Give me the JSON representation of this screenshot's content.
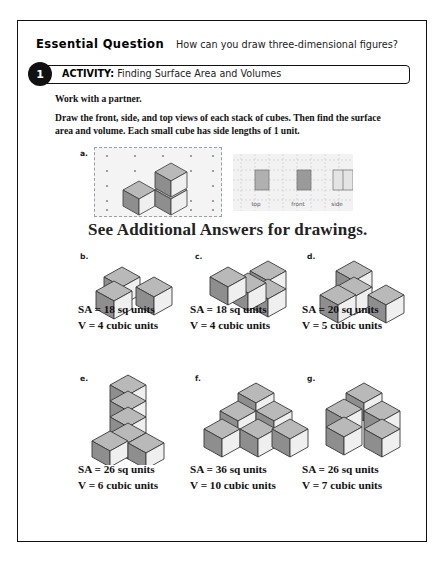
{
  "essential_question": {
    "label": "Essential Question",
    "text": "How can you draw three-dimensional figures?"
  },
  "activity": {
    "number": "1",
    "kicker": "ACTIVITY:",
    "title": "Finding Surface Area and Volumes"
  },
  "instructions": {
    "partner": "Work with a partner.",
    "body": "Draw the front, side, and top views of each stack of cubes. Then find the surface area and volume. Each small cube has side lengths of 1 unit."
  },
  "answer_note": "See Additional Answers for drawings.",
  "part_a": {
    "letter": "a.",
    "view_labels": [
      "top",
      "front",
      "side"
    ]
  },
  "problems": [
    {
      "letter": "b.",
      "surface_area": "SA = 18 sq units",
      "volume": "V = 4 cubic units",
      "cubes": 4
    },
    {
      "letter": "c.",
      "surface_area": "SA = 18 sq units",
      "volume": "V = 4 cubic units",
      "cubes": 4
    },
    {
      "letter": "d.",
      "surface_area": "SA = 20 sq units",
      "volume": "V = 5 cubic units",
      "cubes": 5
    },
    {
      "letter": "e.",
      "surface_area": "SA = 26 sq units",
      "volume": "V = 6 cubic units",
      "cubes": 6
    },
    {
      "letter": "f.",
      "surface_area": "SA = 36 sq units",
      "volume": "V = 10 cubic units",
      "cubes": 10
    },
    {
      "letter": "g.",
      "surface_area": "SA = 26 sq units",
      "volume": "V = 7 cubic units",
      "cubes": 7
    }
  ],
  "colors": {
    "ink": "#111111",
    "cube_top": "#b9b9b9",
    "cube_left": "#8e8e8e",
    "cube_right": "#efefef",
    "panel": "#f2f2f2",
    "grid": "#9aa0a6"
  }
}
